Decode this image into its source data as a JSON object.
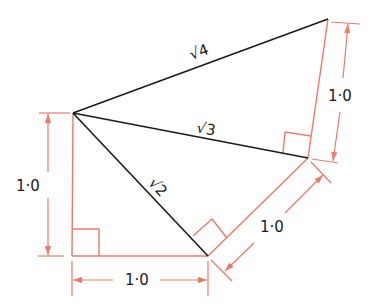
{
  "diagram": {
    "colors": {
      "construction": "#f07868",
      "hypotenuse": "#1a1a1a",
      "background": "#ffffff"
    },
    "points": {
      "A": [
        73,
        113
      ],
      "B": [
        72,
        256
      ],
      "C": [
        208,
        256
      ],
      "D": [
        308,
        158
      ],
      "E": [
        328,
        19
      ]
    },
    "hypotenuses": [
      {
        "from": "A",
        "to": "C",
        "label": "√2"
      },
      {
        "from": "A",
        "to": "D",
        "label": "√3"
      },
      {
        "from": "A",
        "to": "E",
        "label": "√4"
      }
    ],
    "dimensions": [
      {
        "id": "left",
        "label": "1·0"
      },
      {
        "id": "bottom",
        "label": "1·0"
      },
      {
        "id": "diagonal",
        "label": "1·0"
      },
      {
        "id": "right",
        "label": "1·0"
      }
    ]
  }
}
